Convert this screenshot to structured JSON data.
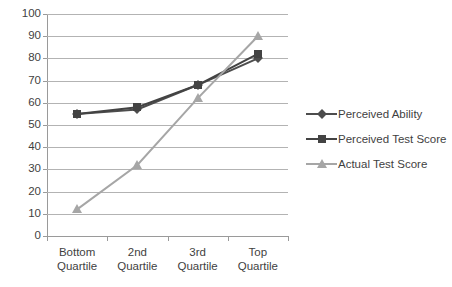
{
  "chart_data": {
    "type": "line",
    "title": "",
    "xlabel": "",
    "ylabel": "",
    "ylim": [
      0,
      100
    ],
    "ytick_step": 10,
    "yticks": [
      100,
      90,
      80,
      70,
      60,
      50,
      40,
      30,
      20,
      10,
      0
    ],
    "grid": true,
    "legend_position": "right",
    "categories": [
      "Bottom Quartile",
      "2nd Quartile",
      "3rd Quartile",
      "Top Quartile"
    ],
    "category_lines": [
      [
        "Bottom",
        "Quartile"
      ],
      [
        "2nd",
        "Quartile"
      ],
      [
        "3rd",
        "Quartile"
      ],
      [
        "Top",
        "Quartile"
      ]
    ],
    "series": [
      {
        "name": "Perceived Ability",
        "marker": "diamond",
        "color": "#4d4d4d",
        "values": [
          55,
          57,
          68,
          80
        ]
      },
      {
        "name": "Perceived Test Score",
        "marker": "square",
        "color": "#434343",
        "values": [
          55,
          58,
          68,
          82
        ]
      },
      {
        "name": "Actual Test Score",
        "marker": "triangle",
        "color": "#a6a6a6",
        "values": [
          12,
          32,
          62,
          90
        ]
      }
    ]
  },
  "legend": {
    "entries": [
      {
        "label": "Perceived Ability"
      },
      {
        "label": "Perceived Test Score"
      },
      {
        "label": "Actual Test Score"
      }
    ]
  },
  "colors": {
    "gridline": "#b3b3b3",
    "axis": "#9a9a9a",
    "text": "#3f3f3f",
    "background": "#ffffff"
  }
}
